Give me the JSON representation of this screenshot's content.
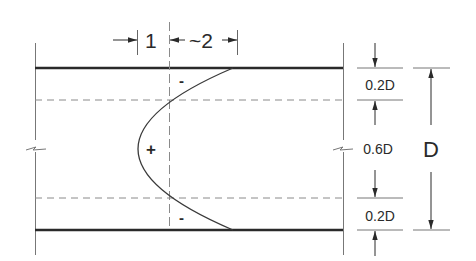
{
  "diagram": {
    "colors": {
      "ink": "#2a2a2a",
      "thin": "#555555",
      "dashed": "#8a8a8a",
      "background": "#ffffff"
    },
    "top_dimensions": [
      {
        "label": "1"
      },
      {
        "label": "~2"
      }
    ],
    "region_signs": {
      "top": "-",
      "middle": "+",
      "bottom": "-"
    },
    "right_dimensions": {
      "segments": [
        {
          "label": "0.2D"
        },
        {
          "label": "0.6D"
        },
        {
          "label": "0.2D"
        }
      ],
      "total": {
        "label": "D"
      }
    }
  }
}
